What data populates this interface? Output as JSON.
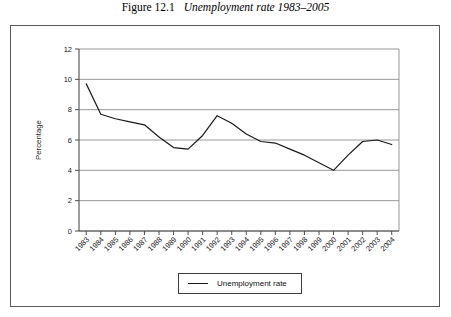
{
  "figure": {
    "number": "Figure 12.1",
    "title": "Unemployment rate 1983–2005"
  },
  "legend": {
    "label": "Unemployment rate"
  },
  "chart_data": {
    "type": "line",
    "title": "Unemployment rate 1983–2005",
    "xlabel": "",
    "ylabel": "Percentage",
    "ylim": [
      0,
      12
    ],
    "yticks": [
      0,
      2,
      4,
      6,
      8,
      10,
      12
    ],
    "grid": true,
    "legend_position": "bottom-center",
    "line_color": "#1a1a1a",
    "categories": [
      "1983",
      "1984",
      "1985",
      "1986",
      "1987",
      "1988",
      "1989",
      "1990",
      "1991",
      "1992",
      "1993",
      "1994",
      "1995",
      "1996",
      "1997",
      "1998",
      "1999",
      "2000",
      "2001",
      "2002",
      "2003",
      "2004"
    ],
    "series": [
      {
        "name": "Unemployment rate",
        "values": [
          9.7,
          7.7,
          7.4,
          7.2,
          7.0,
          6.2,
          5.5,
          5.4,
          6.3,
          7.6,
          7.1,
          6.4,
          5.9,
          5.8,
          5.4,
          5.0,
          4.5,
          4.0,
          5.0,
          5.9,
          6.0,
          5.7
        ]
      }
    ]
  }
}
